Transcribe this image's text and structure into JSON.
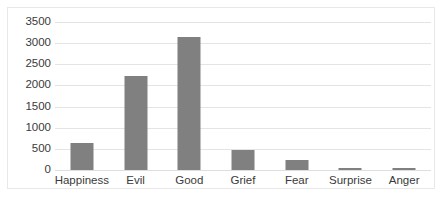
{
  "chart_data": {
    "type": "bar",
    "title": "",
    "subtitle": "",
    "xlabel": "",
    "ylabel": "",
    "categories": [
      "Happiness",
      "Evil",
      "Good",
      "Grief",
      "Fear",
      "Surprise",
      "Anger"
    ],
    "values": [
      640,
      2230,
      3140,
      480,
      230,
      30,
      50
    ],
    "series": [
      {
        "name": "",
        "values": [
          640,
          2230,
          3140,
          480,
          230,
          30,
          50
        ],
        "color": "#808080"
      }
    ],
    "ylim": [
      0,
      3500
    ],
    "ytick_values": [
      0,
      500,
      1000,
      1500,
      2000,
      2500,
      3000,
      3500
    ],
    "ytick_labels": [
      "0",
      "500",
      "1000",
      "1500",
      "2000",
      "2500",
      "3000",
      "3500"
    ],
    "grid": true,
    "grid_axis": "y",
    "legend": false,
    "legend_position": "none",
    "annotations": [],
    "colors": {
      "bar_fill": "#808080",
      "gridline": "#e4e4e4",
      "border": "#e8e8e8",
      "text": "#3a3a3a",
      "background": "#ffffff"
    }
  }
}
